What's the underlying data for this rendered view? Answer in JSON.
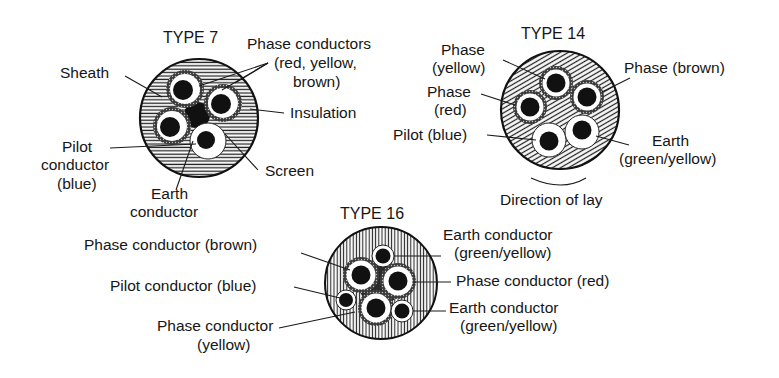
{
  "diagram": {
    "colors": {
      "ink": "#161616",
      "paper": "#ffffff"
    },
    "type7": {
      "title": "TYPE 7",
      "labels": {
        "sheath": "Sheath",
        "phase_1": "Phase conductors",
        "phase_2": "(red, yellow,",
        "phase_3": "brown)",
        "insulation": "Insulation",
        "pilot_1": "Pilot",
        "pilot_2": "conductor",
        "pilot_3": "(blue)",
        "screen": "Screen",
        "earth_1": "Earth",
        "earth_2": "conductor"
      }
    },
    "type14": {
      "title": "TYPE 14",
      "labels": {
        "phase_yellow_1": "Phase",
        "phase_yellow_2": "(yellow)",
        "phase_red_1": "Phase",
        "phase_red_2": "(red)",
        "pilot": "Pilot (blue)",
        "phase_brown": "Phase (brown)",
        "earth_1": "Earth",
        "earth_2": "(green/yellow)",
        "direction": "Direction of lay"
      }
    },
    "type16": {
      "title": "TYPE 16",
      "labels": {
        "phase_brown": "Phase conductor (brown)",
        "pilot": "Pilot conductor (blue)",
        "phase_yellow_1": "Phase conductor",
        "phase_yellow_2": "(yellow)",
        "earth_top_1": "Earth conductor",
        "earth_top_2": "(green/yellow)",
        "phase_red": "Phase conductor (red)",
        "earth_bottom_1": "Earth conductor",
        "earth_bottom_2": "(green/yellow)"
      }
    }
  }
}
